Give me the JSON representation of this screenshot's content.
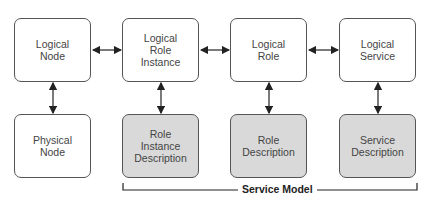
{
  "diagram": {
    "top_row": [
      {
        "id": "logical-node",
        "label": "Logical\nNode",
        "shaded": false
      },
      {
        "id": "logical-role-instance",
        "label": "Logical\nRole\nInstance",
        "shaded": false
      },
      {
        "id": "logical-role",
        "label": "Logical\nRole",
        "shaded": false
      },
      {
        "id": "logical-service",
        "label": "Logical\nService",
        "shaded": false
      }
    ],
    "bottom_row": [
      {
        "id": "physical-node",
        "label": "Physical\nNode",
        "shaded": false
      },
      {
        "id": "role-instance-description",
        "label": "Role\nInstance\nDescription",
        "shaded": true
      },
      {
        "id": "role-description",
        "label": "Role\nDescription",
        "shaded": true
      },
      {
        "id": "service-description",
        "label": "Service\nDescription",
        "shaded": true
      }
    ],
    "group_label": "Service Model",
    "colors": {
      "shaded_fill": "#d9d9d9",
      "stroke": "#555555"
    }
  }
}
